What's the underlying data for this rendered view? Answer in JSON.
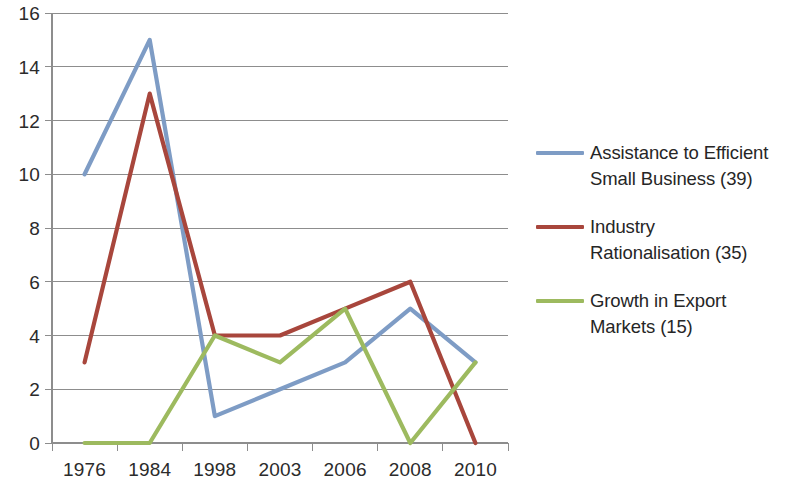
{
  "chart_data": {
    "type": "line",
    "title": "",
    "xlabel": "",
    "ylabel": "",
    "categories": [
      "1976",
      "1984",
      "1998",
      "2003",
      "2006",
      "2008",
      "2010"
    ],
    "x_tick_labels": [
      "1976",
      "1984",
      "1998",
      "2003",
      "2006",
      "2008",
      "2010"
    ],
    "y_tick_labels": [
      "0",
      "2",
      "4",
      "6",
      "8",
      "10",
      "12",
      "14",
      "16"
    ],
    "y_ticks": [
      0,
      2,
      4,
      6,
      8,
      10,
      12,
      14,
      16
    ],
    "ylim": [
      0,
      16
    ],
    "grid": "horizontal",
    "legend_position": "right",
    "series": [
      {
        "name": "Assistance to Efficient Small Business (39)",
        "legend_line1": "Assistance to Efficient",
        "legend_line2": "Small Business (39)",
        "color": "#7E9CC5",
        "values": [
          10,
          15,
          1,
          2,
          3,
          5,
          3
        ]
      },
      {
        "name": "Industry Rationalisation (35)",
        "legend_line1": "Industry",
        "legend_line2": "Rationalisation (35)",
        "color": "#A8463C",
        "values": [
          3,
          13,
          4,
          4,
          5,
          6,
          0
        ]
      },
      {
        "name": "Growth in Export Markets (15)",
        "legend_line1": "Growth in Export",
        "legend_line2": "Markets (15)",
        "color": "#9DBA5F",
        "values": [
          0,
          0,
          4,
          3,
          5,
          0,
          3
        ]
      }
    ]
  },
  "colors": {
    "background": "#ffffff",
    "gridline": "#8d8d8d",
    "axis": "#8d8d8d",
    "tick_text": "#2b2b2b",
    "legend_text": "#262626"
  }
}
